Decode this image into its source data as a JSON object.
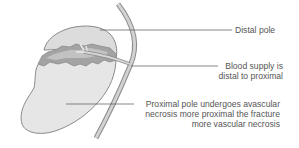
{
  "diagram": {
    "labels": {
      "distal_pole": "Distal pole",
      "blood_supply_line1": "Blood supply is",
      "blood_supply_line2": "distal to proximal",
      "proximal_line1": "Proximal pole undergoes avascular",
      "proximal_line2": "necrosis more proximal the fracture",
      "proximal_line3": "more vascular necrosis"
    },
    "colors": {
      "bone_fill": "#e6e6e6",
      "bone_outline": "#888888",
      "fracture_dark": "#9a9a9a",
      "fracture_mid": "#b8b8b8",
      "vessel": "#cfcfcf",
      "leader_line": "#555555",
      "text": "#555555"
    }
  }
}
